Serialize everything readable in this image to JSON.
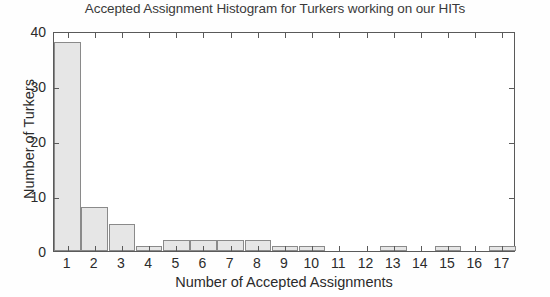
{
  "chart_data": {
    "type": "bar",
    "title": "Accepted Assignment Histogram for Turkers working on our HITs",
    "xlabel": "Number of Accepted Assignments",
    "ylabel": "Number of Turkers",
    "categories": [
      "1",
      "2",
      "3",
      "4",
      "5",
      "6",
      "7",
      "8",
      "9",
      "10",
      "11",
      "12",
      "13",
      "14",
      "15",
      "16",
      "17"
    ],
    "values": [
      38,
      8,
      5,
      1,
      2,
      2,
      2,
      2,
      1,
      1,
      0,
      0,
      1,
      0,
      1,
      0,
      1
    ],
    "xlim": [
      0.5,
      17.5
    ],
    "ylim": [
      0,
      40
    ],
    "ytick_labels": [
      "0",
      "10",
      "20",
      "30",
      "40"
    ],
    "ytick_values": [
      0,
      10,
      20,
      30,
      40
    ],
    "xtick_labels": [
      "1",
      "2",
      "3",
      "4",
      "5",
      "6",
      "7",
      "8",
      "9",
      "10",
      "11",
      "12",
      "13",
      "14",
      "15",
      "16",
      "17"
    ],
    "grid": false,
    "legend": false,
    "bar_fill_color": "#e6e6e6",
    "bar_edge_color": "#8a8a8a",
    "axis_color": "#5a5a5a",
    "text_color": "#2b2b2b",
    "background_color": "#ffffff"
  }
}
